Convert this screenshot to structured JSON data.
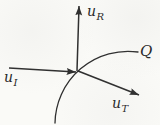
{
  "figure": {
    "background_color": "#fafaf7",
    "line_color": "#2e2e2e",
    "labels": {
      "u_R": {
        "base": "u",
        "sub": "R"
      },
      "u_I": {
        "base": "u",
        "sub": "I"
      },
      "u_T": {
        "base": "u",
        "sub": "T"
      },
      "Q": {
        "base": "Q",
        "sub": ""
      }
    },
    "vectors": [
      {
        "id": "vec-u-i",
        "name": "u_I",
        "from": [
          9,
          68
        ],
        "to": [
          76,
          72
        ]
      },
      {
        "id": "vec-u-r",
        "name": "u_R",
        "from": [
          77,
          71
        ],
        "to": [
          79,
          6
        ]
      },
      {
        "id": "vec-u-t",
        "name": "u_T",
        "from": [
          78,
          71
        ],
        "to": [
          139,
          95
        ]
      }
    ],
    "curve": {
      "id": "curve-q",
      "name": "Q",
      "path": "M 55 123 A 73 73 0 0 1 138 52"
    }
  }
}
